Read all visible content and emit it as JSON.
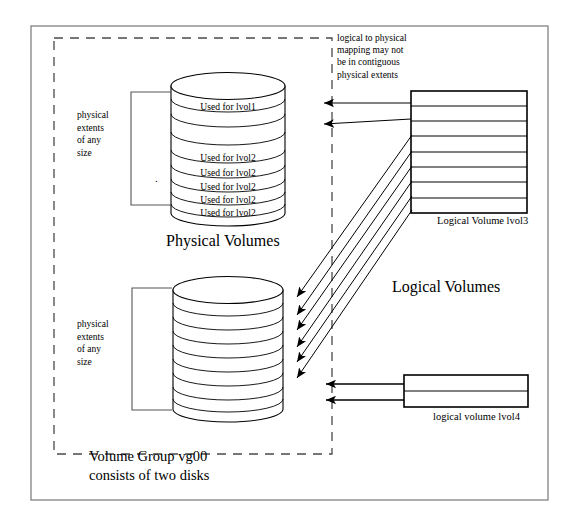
{
  "diagram": {
    "title_hidden": "",
    "captions": {
      "physical_volumes": "Physical Volumes",
      "logical_volumes": "Logical Volumes",
      "logical_volume_lvol3": "Logical Volume lvol3",
      "logical_volume_lvol4": "logical volume lvol4",
      "volume_group_line1": "Volume Group vg00",
      "volume_group_line2": "consists of two disks"
    },
    "annotation": {
      "line1": "logical to physical",
      "line2": "mapping may not",
      "line3": "be in contiguous",
      "line4": "physical extents"
    },
    "bracket_label_top": {
      "line1": "physical",
      "line2": "extents",
      "line3": "of any",
      "line4": "size"
    },
    "bracket_label_bottom": {
      "line1": "physical",
      "line2": "extents",
      "line3": "of any",
      "line4": "size"
    },
    "top_cylinder": {
      "name": "physical-volume-disk-1",
      "extent_count": 8,
      "extent_labels": [
        "",
        "Used for lvol1",
        "",
        "",
        "Used for lvol2",
        "Used for lvol2",
        "Used for lvol2",
        "Used for lvol2",
        "Used for lvol2"
      ]
    },
    "bottom_cylinder": {
      "name": "physical-volume-disk-2",
      "extent_count": 9,
      "extent_labels": [
        "",
        "",
        "",
        "",
        "",
        "",
        "",
        "",
        ""
      ]
    },
    "lvol3_box": {
      "row_count": 8
    },
    "lvol4_box": {
      "row_count": 2
    },
    "colors": {
      "stroke": "#000000",
      "frame": "#888888",
      "dashed": "#555555",
      "background": "#ffffff"
    },
    "stray_mark": "."
  }
}
